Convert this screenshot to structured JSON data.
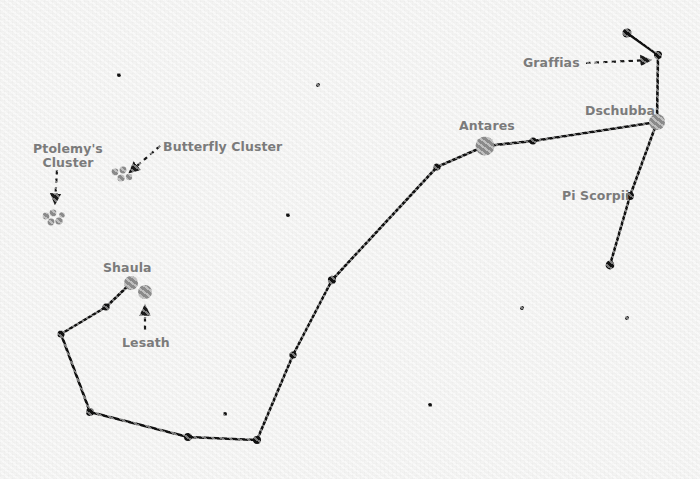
{
  "map": {
    "title": "Scorpius Constellation Star Chart",
    "width": 700,
    "height": 479,
    "background_color": "#f5f5f4",
    "line_color": "#111111",
    "label_color": "#7b7b7b",
    "bright_star_color": "#8c8c8c",
    "star_color": "#111111"
  },
  "labels": {
    "ptolemys_cluster": "Ptolemy's\nCluster",
    "ptolemys_cluster_line1": "Ptolemy's",
    "ptolemys_cluster_line2": "Cluster",
    "butterfly_cluster": "Butterfly Cluster",
    "shaula": "Shaula",
    "lesath": "Lesath",
    "antares": "Antares",
    "dschubba": "Dschubba",
    "graffias": "Graffias",
    "pi_scorpii": "Pi Scorpii"
  },
  "chart_data": {
    "type": "scatter",
    "xlabel": "",
    "ylabel": "",
    "xlim": [
      0,
      700
    ],
    "ylim": [
      0,
      479
    ],
    "grid": false,
    "legend": "none",
    "constellation": "Scorpius",
    "named_stars": [
      {
        "name": "Antares",
        "x": 485,
        "y": 146,
        "radius": 9.5,
        "color": "#8c8c8c",
        "magnitude_class": "bright"
      },
      {
        "name": "Dschubba",
        "x": 657,
        "y": 122,
        "radius": 8.0,
        "color": "#8c8c8c",
        "magnitude_class": "bright"
      },
      {
        "name": "Shaula",
        "x": 131,
        "y": 283,
        "radius": 7.0,
        "color": "#8c8c8c",
        "magnitude_class": "bright"
      },
      {
        "name": "Lesath",
        "x": 145,
        "y": 292,
        "radius": 7.0,
        "color": "#8c8c8c",
        "magnitude_class": "bright"
      },
      {
        "name": "Graffias",
        "x": 658,
        "y": 55,
        "radius": 4.0,
        "color": "#111111",
        "magnitude_class": "normal"
      },
      {
        "name": "Pi Scorpii",
        "x": 630,
        "y": 196,
        "radius": 4.0,
        "color": "#111111",
        "magnitude_class": "normal"
      }
    ],
    "line_stars": [
      {
        "id": "tail_tip",
        "x": 106,
        "y": 307,
        "radius": 3.6
      },
      {
        "id": "tail_2",
        "x": 61,
        "y": 334,
        "radius": 3.6
      },
      {
        "id": "tail_3",
        "x": 90,
        "y": 412,
        "radius": 4.0
      },
      {
        "id": "tail_4",
        "x": 188,
        "y": 437,
        "radius": 4.0
      },
      {
        "id": "tail_5",
        "x": 257,
        "y": 440,
        "radius": 4.0
      },
      {
        "id": "body_1",
        "x": 293,
        "y": 355,
        "radius": 3.6
      },
      {
        "id": "body_2",
        "x": 332,
        "y": 280,
        "radius": 4.2
      },
      {
        "id": "body_3",
        "x": 437,
        "y": 167,
        "radius": 3.6
      },
      {
        "id": "claw_1",
        "x": 533,
        "y": 141,
        "radius": 3.6
      },
      {
        "id": "top_tip",
        "x": 627,
        "y": 33,
        "radius": 4.6
      },
      {
        "id": "lower_tip",
        "x": 610,
        "y": 265,
        "radius": 4.4
      }
    ],
    "constellation_lines": [
      {
        "from": [
          131,
          283
        ],
        "to": [
          106,
          307
        ]
      },
      {
        "from": [
          106,
          307
        ],
        "to": [
          61,
          334
        ]
      },
      {
        "from": [
          61,
          334
        ],
        "to": [
          90,
          412
        ]
      },
      {
        "from": [
          90,
          412
        ],
        "to": [
          188,
          437
        ]
      },
      {
        "from": [
          188,
          437
        ],
        "to": [
          257,
          440
        ]
      },
      {
        "from": [
          257,
          440
        ],
        "to": [
          293,
          355
        ]
      },
      {
        "from": [
          293,
          355
        ],
        "to": [
          332,
          280
        ]
      },
      {
        "from": [
          332,
          280
        ],
        "to": [
          437,
          167
        ]
      },
      {
        "from": [
          437,
          167
        ],
        "to": [
          485,
          146
        ]
      },
      {
        "from": [
          485,
          146
        ],
        "to": [
          533,
          141
        ]
      },
      {
        "from": [
          533,
          141
        ],
        "to": [
          657,
          122
        ]
      },
      {
        "from": [
          657,
          122
        ],
        "to": [
          658,
          55
        ]
      },
      {
        "from": [
          658,
          55
        ],
        "to": [
          627,
          33
        ]
      },
      {
        "from": [
          657,
          122
        ],
        "to": [
          630,
          196
        ]
      },
      {
        "from": [
          630,
          196
        ],
        "to": [
          610,
          265
        ]
      }
    ],
    "open_clusters": [
      {
        "name": "Ptolemy's Cluster",
        "members": [
          {
            "x": 46,
            "y": 216,
            "radius": 3.4
          },
          {
            "x": 53,
            "y": 213,
            "radius": 3.4
          },
          {
            "x": 51,
            "y": 222,
            "radius": 3.4
          },
          {
            "x": 59,
            "y": 221,
            "radius": 3.6
          },
          {
            "x": 62,
            "y": 215,
            "radius": 2.8
          }
        ]
      },
      {
        "name": "Butterfly Cluster",
        "members": [
          {
            "x": 115,
            "y": 172,
            "radius": 3.4
          },
          {
            "x": 123,
            "y": 170,
            "radius": 3.4
          },
          {
            "x": 121,
            "y": 178,
            "radius": 3.6
          },
          {
            "x": 129,
            "y": 177,
            "radius": 3.2
          }
        ]
      }
    ],
    "background_stars": [
      {
        "x": 119,
        "y": 75,
        "radius": 2.0
      },
      {
        "x": 318,
        "y": 85,
        "radius": 2.0
      },
      {
        "x": 288,
        "y": 215,
        "radius": 2.0
      },
      {
        "x": 225,
        "y": 414,
        "radius": 2.0
      },
      {
        "x": 430,
        "y": 405,
        "radius": 2.0
      },
      {
        "x": 522,
        "y": 308,
        "radius": 2.0
      },
      {
        "x": 627,
        "y": 318,
        "radius": 2.0
      }
    ],
    "annotation_arrows": [
      {
        "label": "Ptolemy's Cluster",
        "from": [
          57,
          170
        ],
        "to": [
          55,
          203
        ],
        "style": "dashed"
      },
      {
        "label": "Butterfly Cluster",
        "from": [
          160,
          146
        ],
        "to": [
          130,
          172
        ],
        "style": "dashed"
      },
      {
        "label": "Lesath",
        "from": [
          145,
          330
        ],
        "to": [
          145,
          306
        ],
        "style": "dashed"
      },
      {
        "label": "Graffias",
        "from": [
          586,
          63
        ],
        "to": [
          650,
          60
        ],
        "style": "dashed"
      }
    ],
    "label_positions": [
      {
        "text": "Ptolemy's Cluster",
        "x": 33,
        "y": 142,
        "align": "center",
        "lines": 2
      },
      {
        "text": "Butterfly Cluster",
        "x": 163,
        "y": 140,
        "align": "left",
        "lines": 1
      },
      {
        "text": "Shaula",
        "x": 103,
        "y": 261,
        "align": "left",
        "lines": 1
      },
      {
        "text": "Lesath",
        "x": 122,
        "y": 336,
        "align": "left",
        "lines": 1
      },
      {
        "text": "Antares",
        "x": 459,
        "y": 119,
        "align": "left",
        "lines": 1
      },
      {
        "text": "Dschubba",
        "x": 585,
        "y": 104,
        "align": "left",
        "lines": 1
      },
      {
        "text": "Graffias",
        "x": 523,
        "y": 56,
        "align": "left",
        "lines": 1
      },
      {
        "text": "Pi Scorpii",
        "x": 562,
        "y": 189,
        "align": "left",
        "lines": 1
      }
    ]
  }
}
